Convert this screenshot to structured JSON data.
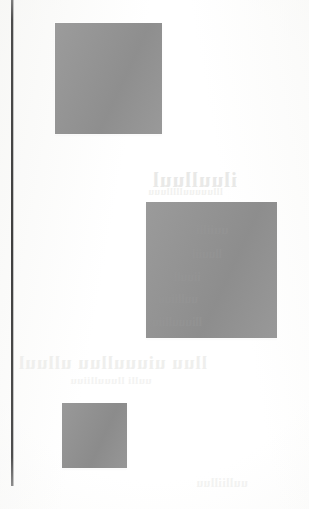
{
  "page": {
    "label": "scanned-page",
    "width": 309,
    "height": 509,
    "background_color": "#fdfdfc"
  },
  "margin_rule": {
    "name": "left-margin-rule",
    "color": "#3f3f3f",
    "x": 11,
    "top": 0,
    "height": 486,
    "width": 2
  },
  "blocks": [
    {
      "id": "block-1",
      "label": "upper-grey-block",
      "color": "#949494",
      "x": 55,
      "y": 23,
      "width": 107,
      "height": 111
    },
    {
      "id": "block-2",
      "label": "middle-grey-block",
      "color": "#939393",
      "x": 146,
      "y": 202,
      "width": 131,
      "height": 136
    },
    {
      "id": "block-3",
      "label": "lower-grey-block",
      "color": "#919191",
      "x": 62,
      "y": 403,
      "width": 65,
      "height": 65
    }
  ],
  "ghost_text": {
    "note": "faint mirrored show-through from the reverse side of the sheet; not legible",
    "lines": [
      {
        "id": "ghost-1",
        "text": "iluulluul"
      },
      {
        "id": "ghost-2",
        "text": "llluuuuullllluuu"
      },
      {
        "id": "ghost-3",
        "text": "lluu uiuuulluu ulluul"
      },
      {
        "id": "ghost-4",
        "text": "uulli lluuulliiuu"
      },
      {
        "id": "ghost-5",
        "text": "uulliilluu"
      }
    ],
    "over_block_lines": [
      {
        "id": "ghost-b1",
        "text": "uuiilli"
      },
      {
        "id": "ghost-b2",
        "text": "lluuiil"
      },
      {
        "id": "ghost-b3",
        "text": "iiuull"
      },
      {
        "id": "ghost-b4",
        "text": "uulliiuu"
      },
      {
        "id": "ghost-b5",
        "text": "lliuuulliiu"
      }
    ]
  }
}
